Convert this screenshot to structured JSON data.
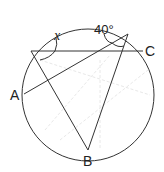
{
  "diagram": {
    "type": "circle-inscribed-angles",
    "points": {
      "A": {
        "label": "A",
        "x": 24,
        "y": 94
      },
      "B": {
        "label": "B",
        "x": 88,
        "y": 150
      },
      "C": {
        "label": "C",
        "x": 143,
        "y": 51
      },
      "P": {
        "label": "",
        "x": 31,
        "y": 51
      },
      "Q": {
        "label": "",
        "x": 128,
        "y": 34
      }
    },
    "angles": {
      "known": "40°",
      "unknown": "x"
    },
    "colors": {
      "stroke": "#333333",
      "faint": "#e6e6e6"
    }
  }
}
